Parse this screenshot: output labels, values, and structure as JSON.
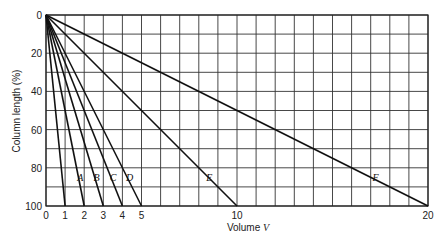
{
  "chart_data": {
    "type": "line",
    "title": "",
    "xlabel": "Volume V",
    "ylabel": "Column length (%)",
    "xlim": [
      0,
      20
    ],
    "ylim": [
      0,
      100
    ],
    "y_inverted": true,
    "grid": true,
    "grid_x_step": 1,
    "grid_y_step": 10,
    "legend_position": "inline labels near y=85%",
    "x_ticks": [
      0,
      1,
      2,
      3,
      4,
      5,
      10,
      20
    ],
    "y_ticks": [
      0,
      20,
      40,
      60,
      80,
      100
    ],
    "series": [
      {
        "name": "(unlabeled)",
        "x": [
          0,
          1
        ],
        "y": [
          0,
          100
        ],
        "label_x": null
      },
      {
        "name": "A",
        "x": [
          0,
          2
        ],
        "y": [
          0,
          100
        ],
        "label_x": 1.85
      },
      {
        "name": "B",
        "x": [
          0,
          3
        ],
        "y": [
          0,
          100
        ],
        "label_x": 2.7
      },
      {
        "name": "C",
        "x": [
          0,
          4
        ],
        "y": [
          0,
          100
        ],
        "label_x": 3.55
      },
      {
        "name": "D",
        "x": [
          0,
          5
        ],
        "y": [
          0,
          100
        ],
        "label_x": 4.4
      },
      {
        "name": "E",
        "x": [
          0,
          10
        ],
        "y": [
          0,
          100
        ],
        "label_x": 8.6
      },
      {
        "name": "F",
        "x": [
          0,
          20
        ],
        "y": [
          0,
          100
        ],
        "label_x": 17.3
      }
    ],
    "label_y": 85
  },
  "labels": {
    "xlabel": "Volume V",
    "xlabel_main": "Volume ",
    "xlabel_var": "V",
    "ylabel": "Column length (%)"
  }
}
